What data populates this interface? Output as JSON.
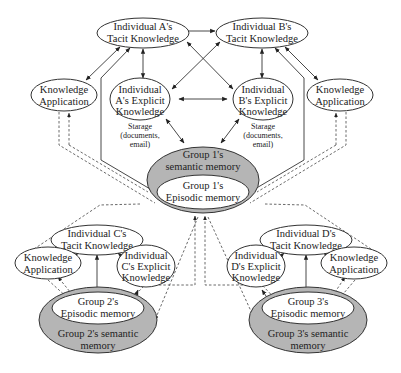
{
  "diagram": {
    "individual_a_tacit": [
      "Individual A's",
      "Tacit Knowledge"
    ],
    "individual_b_tacit": [
      "Individual B's",
      "Tacit Knowledge"
    ],
    "individual_a_explicit": [
      "Individual",
      "A's Explicit",
      "Knowledge"
    ],
    "individual_b_explicit": [
      "Individual",
      "B's Explicit",
      "Knowledge"
    ],
    "knowledge_app_left_top": [
      "Knowledge",
      "Application"
    ],
    "knowledge_app_right_top": [
      "Knowledge",
      "Application"
    ],
    "storage_left": [
      "Starage",
      "(documents,",
      "email)"
    ],
    "storage_right": [
      "Starage",
      "(documents,",
      "email)"
    ],
    "group1_semantic": [
      "Group 1's",
      "semantic memory"
    ],
    "group1_episodic": [
      "Group 1's",
      "Episodic memory"
    ],
    "individual_c_tacit": [
      "Individual C's",
      "Tacit Knowledge"
    ],
    "individual_d_tacit": [
      "Individual D's",
      "Tacit Knowledge"
    ],
    "knowledge_app_c": [
      "Knowledge",
      "Application"
    ],
    "knowledge_app_d": [
      "Knowledge",
      "Application"
    ],
    "individual_c_explicit": [
      "Individual",
      "C's Explicit",
      "Knowledge"
    ],
    "individual_d_explicit": [
      "Individual",
      "D's Explicit",
      "Knowledge"
    ],
    "group2_episodic": [
      "Group 2's",
      "Episodic memory"
    ],
    "group2_semantic": [
      "Group 2's semantic",
      "memory"
    ],
    "group3_episodic": [
      "Group 3's",
      "Episodic memory"
    ],
    "group3_semantic": [
      "Group 3's semantic",
      "memory"
    ]
  },
  "colors": {
    "semantic_fill": "#b5b5b5",
    "stroke": "#333333"
  }
}
